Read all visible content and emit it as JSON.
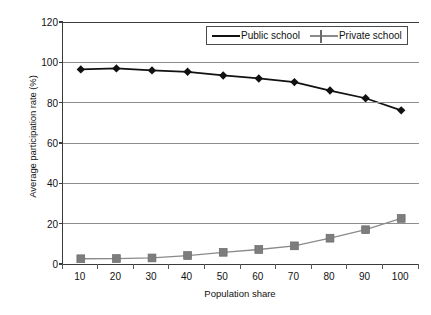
{
  "chart_data": {
    "type": "line",
    "title": "",
    "xlabel": "Population share",
    "ylabel": "Average participation rate (%)",
    "x": [
      10,
      20,
      30,
      40,
      50,
      60,
      70,
      80,
      90,
      100
    ],
    "xticklabels": [
      "10",
      "20",
      "30",
      "40",
      "50",
      "60",
      "70",
      "80",
      "90",
      "100"
    ],
    "yticklabels": [
      "0",
      "20",
      "40",
      "60",
      "80",
      "100",
      "120"
    ],
    "yticks": [
      0,
      20,
      40,
      60,
      80,
      100,
      120
    ],
    "ylim": [
      0,
      120
    ],
    "grid": "horizontal",
    "legend_position": "top-center-inside",
    "series": [
      {
        "name": "Public school",
        "marker": "diamond",
        "color": "#111111",
        "values": [
          96.5,
          97.0,
          96.0,
          95.3,
          93.5,
          92.0,
          90.2,
          86.0,
          82.2,
          76.2
        ]
      },
      {
        "name": "Private school",
        "marker": "square",
        "color": "#7d7d7d",
        "values": [
          2.6,
          2.7,
          3.0,
          4.2,
          5.8,
          7.2,
          9.0,
          12.8,
          17.0,
          22.6
        ]
      }
    ]
  },
  "legend": {
    "items": [
      {
        "label": "Public school"
      },
      {
        "label": "Private school"
      }
    ]
  },
  "colors": {
    "public": "#111111",
    "private": "#7d7d7d",
    "grid": "#8d8d8d",
    "axis": "#3a3a3a",
    "background": "#ffffff"
  }
}
